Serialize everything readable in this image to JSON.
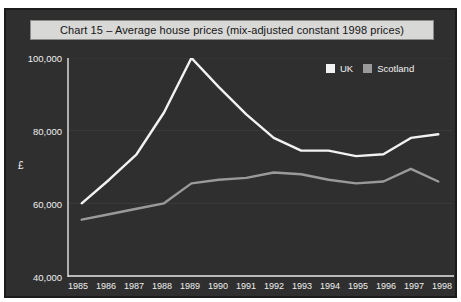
{
  "title": "Chart 15 – Average house prices (mix-adjusted constant 1998 prices)",
  "axes": {
    "ylabel": "£",
    "yticks": [
      "100,000",
      "80,000",
      "60,000",
      "40,000"
    ]
  },
  "legend": [
    {
      "label": "UK",
      "color": "#f2f2f2",
      "name": "legend-swatch-uk"
    },
    {
      "label": "Scotland",
      "color": "#9a9a9a",
      "name": "legend-swatch-scotland"
    }
  ],
  "chart_data": {
    "type": "line",
    "title": "Chart 15 – Average house prices (mix-adjusted constant 1998 prices)",
    "xlabel": "",
    "ylabel": "£",
    "categories": [
      "1985",
      "1986",
      "1987",
      "1988",
      "1989",
      "1990",
      "1991",
      "1992",
      "1993",
      "1994",
      "1995",
      "1996",
      "1997",
      "1998"
    ],
    "ylim": [
      40000,
      100000
    ],
    "yticks": [
      40000,
      60000,
      80000,
      100000
    ],
    "grid": true,
    "legend_position": "top-right",
    "series": [
      {
        "name": "UK",
        "color": "#f2f2f2",
        "values": [
          60000,
          66500,
          73500,
          85000,
          100000,
          92000,
          84500,
          78000,
          74500,
          74500,
          73000,
          73500,
          78000,
          79000
        ]
      },
      {
        "name": "Scotland",
        "color": "#9a9a9a",
        "values": [
          55500,
          57000,
          58500,
          60000,
          65500,
          66500,
          67000,
          68500,
          68000,
          66500,
          65500,
          66000,
          69500,
          66000
        ]
      }
    ]
  }
}
